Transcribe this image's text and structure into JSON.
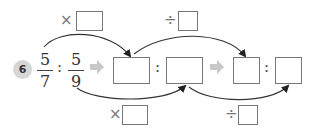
{
  "problem": {
    "number": "6",
    "left_fraction": {
      "numerator": "5",
      "denominator": "7"
    },
    "right_fraction": {
      "numerator": "5",
      "denominator": "9"
    },
    "ratio_separator": ":",
    "operators": {
      "top_left": "×",
      "top_right": "÷",
      "bottom_left": "×",
      "bottom_right": "÷"
    },
    "answer_boxes": {
      "top_multiplier": "",
      "top_divisor": "",
      "bottom_multiplier": "",
      "bottom_divisor": "",
      "step1_left": "",
      "step1_right": "",
      "step2_left": "",
      "step2_right": ""
    },
    "colors": {
      "arrow_gray": "#c8c8c8",
      "stroke": "#333333",
      "box_border": "#777777",
      "circle_bg": "#d6d6d6"
    }
  }
}
